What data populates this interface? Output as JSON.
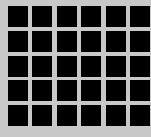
{
  "grid": {
    "rows": 5,
    "columns": 6,
    "background_color": "#c8c8c8",
    "cell_color": "#000000",
    "cell_size": 20,
    "col_x": [
      8,
      32,
      57,
      81,
      106,
      130
    ],
    "row_y": [
      6,
      31,
      56,
      80,
      105
    ]
  }
}
